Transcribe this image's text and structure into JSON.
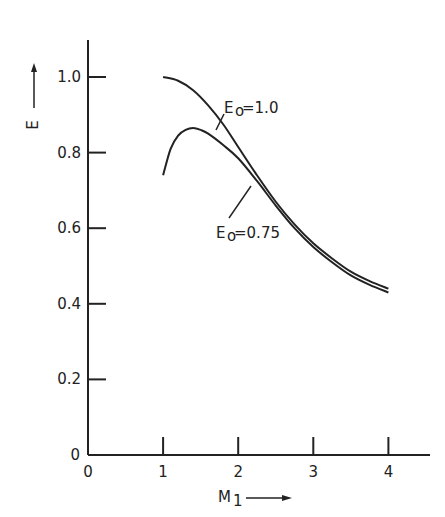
{
  "chart_data": {
    "type": "line",
    "title": "",
    "xlabel": "M₁",
    "ylabel": "E",
    "xlim": [
      0,
      4.6
    ],
    "ylim": [
      0,
      1.1
    ],
    "grid": false,
    "legend": "inline labels on curves",
    "x_ticks": [
      "0",
      "1",
      "2",
      "3",
      "4"
    ],
    "y_ticks": [
      "0",
      "0.2",
      "0.4",
      "0.6",
      "0.8",
      "1.0"
    ],
    "series": [
      {
        "name": "E₀=1.0",
        "x": [
          1.0,
          1.2,
          1.4,
          1.6,
          1.8,
          2.0,
          2.25,
          2.5,
          2.75,
          3.0,
          3.25,
          3.5,
          3.75,
          4.0
        ],
        "values": [
          1.0,
          0.99,
          0.965,
          0.925,
          0.875,
          0.815,
          0.74,
          0.67,
          0.61,
          0.56,
          0.52,
          0.485,
          0.46,
          0.44
        ]
      },
      {
        "name": "E₀=0.75",
        "x": [
          1.0,
          1.1,
          1.2,
          1.3,
          1.4,
          1.5,
          1.6,
          1.8,
          2.0,
          2.25,
          2.5,
          2.75,
          3.0,
          3.25,
          3.5,
          3.75,
          4.0
        ],
        "values": [
          0.74,
          0.81,
          0.845,
          0.86,
          0.865,
          0.86,
          0.85,
          0.82,
          0.785,
          0.725,
          0.66,
          0.6,
          0.55,
          0.51,
          0.475,
          0.45,
          0.43
        ]
      }
    ],
    "annotations": [
      {
        "text": "E₀=1.0",
        "points_to": "upper curve near M≈1.8"
      },
      {
        "text": "E₀=0.75",
        "points_to": "lower curve near M≈2.1"
      }
    ]
  },
  "labels": {
    "ylabel": "E",
    "xlabel_main": "M",
    "xlabel_sub": "1",
    "curve1_main": "E",
    "curve1_sub": "o",
    "curve1_val": "=1.0",
    "curve2_main": "E",
    "curve2_sub": "o",
    "curve2_val": "=0.75"
  }
}
